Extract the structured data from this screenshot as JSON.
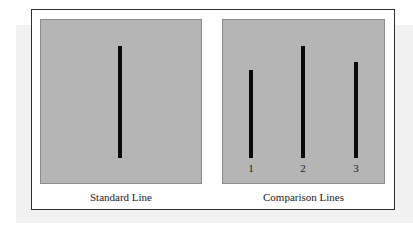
{
  "figure": {
    "standard_panel": {
      "caption": "Standard Line",
      "line": {
        "top": 46,
        "bottom": 158,
        "x": 118
      }
    },
    "comparison_panel": {
      "caption": "Comparison Lines",
      "lines": [
        {
          "label": "1",
          "top": 70,
          "bottom": 158,
          "x": 249
        },
        {
          "label": "2",
          "top": 46,
          "bottom": 158,
          "x": 301
        },
        {
          "label": "3",
          "top": 62,
          "bottom": 158,
          "x": 354
        }
      ]
    },
    "colors": {
      "panel_fill": "#b5b5b5",
      "line": "#0a0a0a",
      "frame": "#2e2e2e"
    }
  }
}
